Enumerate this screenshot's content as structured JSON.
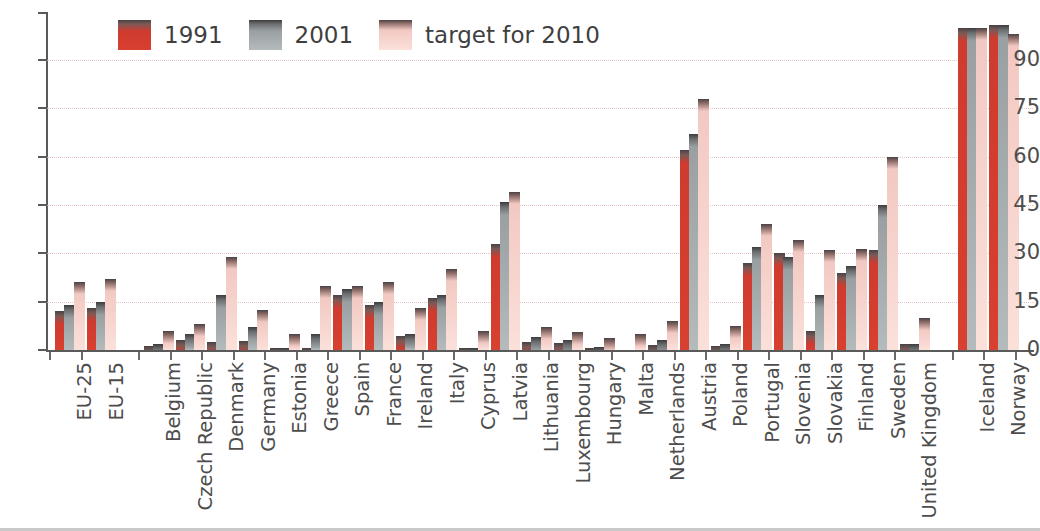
{
  "legend": {
    "position": "top-left",
    "items": [
      {
        "label": "1991",
        "color": "#d8402f",
        "series_key": "v1991"
      },
      {
        "label": "2001",
        "color": "#b4bbbd",
        "series_key": "v2001"
      },
      {
        "label": "target for 2010",
        "color": "#fbe0da",
        "series_key": "target2010"
      }
    ]
  },
  "axes": {
    "y_ticks": [
      0,
      15,
      30,
      45,
      60,
      75,
      90
    ],
    "ylim": [
      0,
      105
    ],
    "ylabel": "",
    "xlabel": "",
    "grid": true
  },
  "chart_data": {
    "type": "bar",
    "title": "",
    "subtitle": "",
    "xlabel": "",
    "ylabel": "",
    "ylim": [
      0,
      105
    ],
    "grid": true,
    "legend_position": "top-left",
    "categories": [
      "EU-25",
      "EU-15",
      "Belgium",
      "Czech Republic",
      "Denmark",
      "Germany",
      "Estonia",
      "Greece",
      "Spain",
      "France",
      "Ireland",
      "Italy",
      "Cyprus",
      "Latvia",
      "Lithuania",
      "Luxembourg",
      "Hungary",
      "Malta",
      "Netherlands",
      "Austria",
      "Poland",
      "Portugal",
      "Slovenia",
      "Slovakia",
      "Finland",
      "Sweden",
      "United Kingdom",
      "Iceland",
      "Norway"
    ],
    "series": [
      {
        "name": "1991",
        "color": "#d8402f",
        "values": [
          12,
          13,
          1.1,
          3.2,
          2.5,
          2.7,
          0.2,
          0.6,
          17,
          14,
          4.5,
          16,
          0.1,
          33,
          2.5,
          2.2,
          0.5,
          0,
          1.6,
          62,
          1.4,
          27,
          30,
          6,
          24,
          31,
          1.8,
          100,
          101
        ]
      },
      {
        "name": "2001",
        "color": "#b4bbbd",
        "values": [
          14,
          15,
          2.0,
          5.0,
          17,
          7.0,
          0.2,
          5.0,
          19,
          15,
          5.0,
          17,
          0.1,
          46,
          4.0,
          3.0,
          1.0,
          0,
          3.0,
          67,
          2.0,
          32,
          29,
          17,
          26,
          45,
          2.0,
          100,
          101
        ]
      },
      {
        "name": "target for 2010",
        "color": "#fbe0da",
        "values": [
          21,
          22,
          6.0,
          8.0,
          29,
          12.5,
          5.1,
          20,
          20,
          21,
          13,
          25,
          6.0,
          49,
          7.0,
          5.7,
          3.6,
          5.0,
          9.0,
          78,
          7.5,
          39,
          34,
          31,
          31.5,
          60,
          10,
          100,
          98
        ]
      }
    ]
  },
  "footer": {
    "note": ""
  }
}
